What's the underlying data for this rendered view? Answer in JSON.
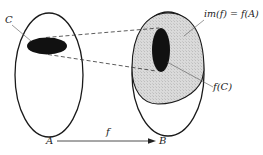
{
  "diagram": {
    "type": "set-mapping",
    "sets": {
      "domain": {
        "name": "A"
      },
      "codomain": {
        "name": "B"
      }
    },
    "subset_label": "C",
    "image_label": "im(f) = f(A)",
    "subset_image_label": "f(C)",
    "function_label": "f",
    "colors": {
      "outline": "#1a1a1a",
      "subset_fill": "#111111",
      "image_fill": "#d6d6d6",
      "dashed_line": "#333333"
    }
  }
}
